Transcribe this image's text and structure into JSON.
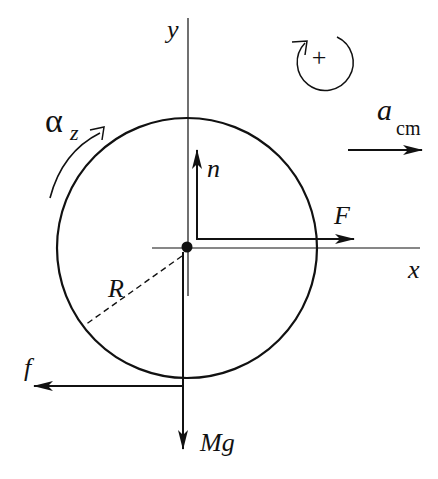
{
  "diagram": {
    "colors": {
      "ink": "#111111",
      "background": "#ffffff"
    },
    "labels": {
      "y_axis": "y",
      "x_axis": "x",
      "normal_force": "n",
      "applied_force": "F",
      "friction": "f",
      "weight": "Mg",
      "radius": "R",
      "angular_accel_symbol": "α",
      "angular_accel_sub": "z",
      "accel_symbol": "a",
      "accel_sub": "cm",
      "positive_rotation": "+"
    },
    "geometry": {
      "center": [
        187,
        247
      ],
      "radius": 130
    }
  }
}
